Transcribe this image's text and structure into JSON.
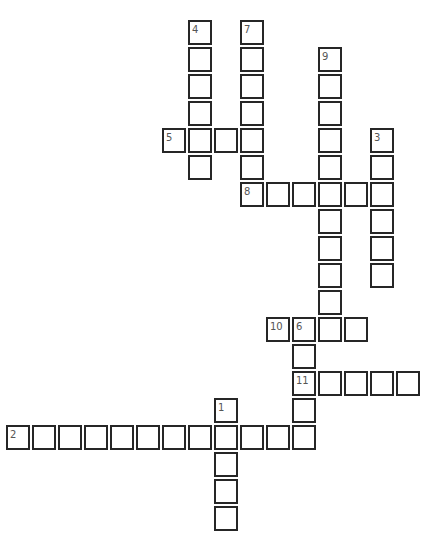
{
  "puzzle": {
    "type": "crossword",
    "grid": {
      "origin_x": 6,
      "origin_y": 20,
      "col_pitch": 26,
      "row_pitch": 27
    },
    "colors": {
      "border": "#262626",
      "cell_bg": "#ffffff",
      "number": "#555555"
    },
    "entries": [
      {
        "number": "1",
        "direction": "down",
        "col": 8,
        "row": 14,
        "length": 5
      },
      {
        "number": "2",
        "direction": "across",
        "col": 0,
        "row": 15,
        "length": 12
      },
      {
        "number": "3",
        "direction": "down",
        "col": 14,
        "row": 4,
        "length": 6
      },
      {
        "number": "4",
        "direction": "down",
        "col": 7,
        "row": 0,
        "length": 6
      },
      {
        "number": "5",
        "direction": "across",
        "col": 6,
        "row": 4,
        "length": 4
      },
      {
        "number": "6",
        "direction": "down",
        "col": 11,
        "row": 11,
        "length": 5
      },
      {
        "number": "7",
        "direction": "down",
        "col": 9,
        "row": 0,
        "length": 7
      },
      {
        "number": "8",
        "direction": "across",
        "col": 9,
        "row": 6,
        "length": 6
      },
      {
        "number": "9",
        "direction": "down",
        "col": 12,
        "row": 1,
        "length": 11
      },
      {
        "number": "10",
        "direction": "across",
        "col": 10,
        "row": 11,
        "length": 4
      },
      {
        "number": "11",
        "direction": "across",
        "col": 11,
        "row": 13,
        "length": 5
      }
    ]
  }
}
